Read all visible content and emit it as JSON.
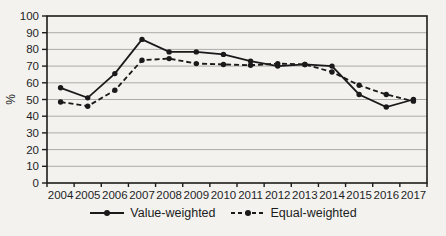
{
  "chart_data": {
    "type": "line",
    "title": "",
    "xlabel": "",
    "ylabel": "%",
    "ylim": [
      0,
      100
    ],
    "ytick_step": 10,
    "grid": true,
    "legend_position": "bottom",
    "categories": [
      "2004",
      "2005",
      "2006",
      "2007",
      "2008",
      "2009",
      "2010",
      "2011",
      "2012",
      "2013",
      "2014",
      "2015",
      "2016",
      "2017"
    ],
    "series": [
      {
        "name": "Value-weighted",
        "style": "solid",
        "marker": "circle",
        "color": "#1a1a1a",
        "values": [
          57,
          51,
          65.5,
          86,
          78.5,
          78.5,
          77,
          73,
          70,
          71,
          70,
          53,
          45.5,
          50
        ]
      },
      {
        "name": "Equal-weighted",
        "style": "dashed",
        "marker": "circle",
        "color": "#1a1a1a",
        "values": [
          48.5,
          46,
          55.5,
          73.5,
          74.5,
          71.5,
          71,
          70.5,
          71.5,
          71,
          66.5,
          58.5,
          53,
          49
        ]
      }
    ]
  },
  "colors": {
    "background": "#f3f2ef",
    "axis": "#1c1c1c",
    "gridline": "#adaba7",
    "text": "#1f1f1f"
  },
  "layout_values": {
    "plot_left": 47,
    "plot_top": 16,
    "plot_right": 427,
    "plot_bottom": 183
  }
}
